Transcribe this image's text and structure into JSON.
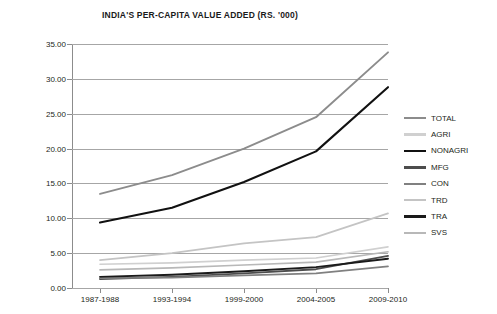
{
  "chart_data": {
    "type": "line",
    "title": "INDIA'S PER-CAPITA VALUE ADDED (RS. '000)",
    "xlabel": "",
    "ylabel": "",
    "grid": true,
    "legend_position": "right",
    "ylim": [
      0,
      35
    ],
    "yticks": [
      "0.00",
      "5.00",
      "10.00",
      "15.00",
      "20.00",
      "25.00",
      "30.00",
      "35.00"
    ],
    "ytick_values": [
      0,
      5,
      10,
      15,
      20,
      25,
      30,
      35
    ],
    "categories": [
      "1987-1988",
      "1993-1994",
      "1999-2000",
      "2004-2005",
      "2009-2010"
    ],
    "series": [
      {
        "name": "TOTAL",
        "color": "#8c8c8c",
        "width": 1.9,
        "values": [
          13.5,
          16.2,
          20.0,
          24.5,
          33.8
        ]
      },
      {
        "name": "AGRI",
        "color": "#d0d0d0",
        "width": 1.6,
        "values": [
          3.4,
          3.6,
          4.0,
          4.3,
          5.9
        ]
      },
      {
        "name": "NONAGRI",
        "color": "#111111",
        "width": 2.1,
        "values": [
          9.4,
          11.5,
          15.2,
          19.6,
          28.8
        ]
      },
      {
        "name": "MFG",
        "color": "#4d4d4d",
        "width": 1.9,
        "values": [
          1.3,
          1.6,
          2.1,
          2.7,
          4.6
        ]
      },
      {
        "name": "CON",
        "color": "#808080",
        "width": 1.7,
        "values": [
          1.4,
          1.5,
          1.8,
          2.1,
          3.1
        ]
      },
      {
        "name": "TRD",
        "color": "#c4c4c4",
        "width": 1.7,
        "values": [
          4.0,
          5.0,
          6.4,
          7.3,
          10.7
        ]
      },
      {
        "name": "TRA",
        "color": "#1a1a1a",
        "width": 1.9,
        "values": [
          1.6,
          1.9,
          2.4,
          3.0,
          4.2
        ]
      },
      {
        "name": "SVS",
        "color": "#b8b8b8",
        "width": 1.7,
        "values": [
          2.6,
          2.9,
          3.3,
          3.7,
          5.2
        ]
      }
    ]
  }
}
